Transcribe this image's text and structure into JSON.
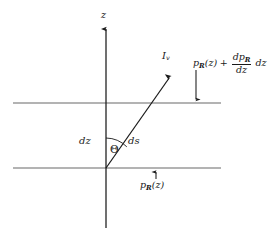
{
  "figure": {
    "background_color": "#ffffff",
    "axis_color": "#1a1a1a",
    "slab_line_color": "#9a9a9a",
    "ray_color": "#1a1a1a",
    "width": 269,
    "height": 238
  },
  "axis": {
    "label": "z",
    "orientation": "vertical",
    "arrow_direction": "up",
    "x": 106,
    "top_y": 27,
    "bottom_y": 228
  },
  "slab": {
    "top_line": {
      "y": 103,
      "x_start": 13,
      "x_end": 221,
      "pressure_label": {
        "base": "p",
        "subscript": "R",
        "argument": "(z)",
        "operator": "+",
        "fraction_numerator_base": "dp",
        "fraction_numerator_subscript": "R",
        "fraction_denominator": "dz",
        "trailing": "dz",
        "plain_text": "p_R(z) + (dp_R/dz) dz"
      },
      "callout_arrow": {
        "direction": "down",
        "x": 196,
        "from_y": 71,
        "to_y": 101
      }
    },
    "bottom_line": {
      "y": 168,
      "x_start": 13,
      "x_end": 221,
      "pressure_label": {
        "base": "p",
        "subscript": "R",
        "argument": "(z)",
        "plain_text": "p_R(z)"
      },
      "callout_arrow": {
        "direction": "up",
        "x": 156,
        "from_y": 178,
        "to_y": 170
      }
    },
    "thickness_label": "dz"
  },
  "ray": {
    "label_base": "I",
    "label_subscript": "v",
    "plain_text": "I_v",
    "path_label": "ds",
    "angle_label": "Θ",
    "origin_x": 106,
    "origin_y": 168,
    "tip_x": 171,
    "tip_y": 75
  }
}
